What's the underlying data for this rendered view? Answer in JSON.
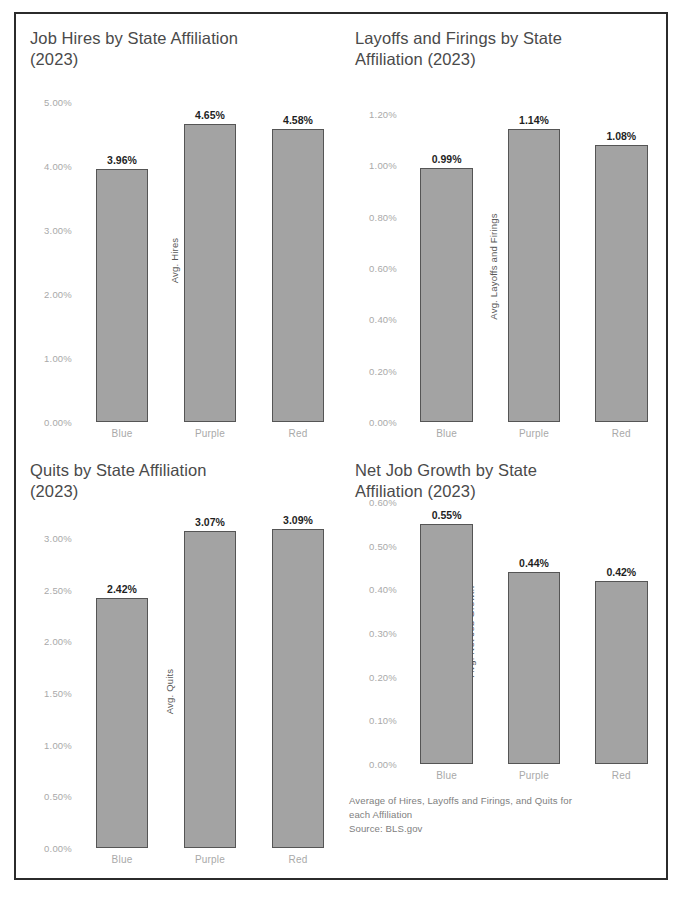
{
  "figure": {
    "footnote": "Average of Hires, Layoffs and Firings, and Quits for\neach Affiliation\nSource: BLS.gov",
    "frame_color": "#2b2b2b",
    "bar_fill": "#a3a3a3",
    "bar_border": "#555555",
    "tick_color": "#a9a9a9",
    "title_color": "#4a4a4a"
  },
  "chart_data": [
    {
      "type": "bar",
      "title": "Job Hires by State Affiliation\n(2023)",
      "xlabel": "",
      "ylabel": "Avg. Hires",
      "categories": [
        "Blue",
        "Purple",
        "Red"
      ],
      "values": [
        3.96,
        4.65,
        4.58
      ],
      "value_labels": [
        "3.96%",
        "4.65%",
        "4.58%"
      ],
      "yticks": [
        "0.00%",
        "1.00%",
        "2.00%",
        "3.00%",
        "4.00%",
        "5.00%"
      ],
      "ytick_values": [
        0,
        1,
        2,
        3,
        4,
        5
      ],
      "ylim": [
        0,
        5
      ],
      "grid": false,
      "legend": "none"
    },
    {
      "type": "bar",
      "title": "Layoffs and Firings by State\nAffiliation (2023)",
      "xlabel": "",
      "ylabel": "Avg. Layoffs and Firings",
      "categories": [
        "Blue",
        "Purple",
        "Red"
      ],
      "values": [
        0.99,
        1.14,
        1.08
      ],
      "value_labels": [
        "0.99%",
        "1.14%",
        "1.08%"
      ],
      "yticks": [
        "0.00%",
        "0.20%",
        "0.40%",
        "0.60%",
        "0.80%",
        "1.00%",
        "1.20%"
      ],
      "ytick_values": [
        0,
        0.2,
        0.4,
        0.6,
        0.8,
        1.0,
        1.2
      ],
      "ylim": [
        0,
        1.2
      ],
      "grid": false,
      "legend": "none"
    },
    {
      "type": "bar",
      "title": "Quits by State Affiliation\n(2023)",
      "xlabel": "",
      "ylabel": "Avg. Quits",
      "categories": [
        "Blue",
        "Purple",
        "Red"
      ],
      "values": [
        2.42,
        3.07,
        3.09
      ],
      "value_labels": [
        "2.42%",
        "3.07%",
        "3.09%"
      ],
      "yticks": [
        "0.00%",
        "0.50%",
        "1.00%",
        "1.50%",
        "2.00%",
        "2.50%",
        "3.00%"
      ],
      "ytick_values": [
        0,
        0.5,
        1.0,
        1.5,
        2.0,
        2.5,
        3.0
      ],
      "ylim": [
        0,
        3.0
      ],
      "grid": false,
      "legend": "none"
    },
    {
      "type": "bar",
      "title": "Net Job Growth by State\nAffiliation (2023)",
      "xlabel": "",
      "ylabel": "Avg. Net Job Growth",
      "categories": [
        "Blue",
        "Purple",
        "Red"
      ],
      "values": [
        0.55,
        0.44,
        0.42
      ],
      "value_labels": [
        "0.55%",
        "0.44%",
        "0.42%"
      ],
      "yticks": [
        "0.00%",
        "0.10%",
        "0.20%",
        "0.30%",
        "0.40%",
        "0.50%",
        "0.60%"
      ],
      "ytick_values": [
        0,
        0.1,
        0.2,
        0.3,
        0.4,
        0.5,
        0.6
      ],
      "ylim": [
        0,
        0.6
      ],
      "grid": false,
      "legend": "none"
    }
  ]
}
